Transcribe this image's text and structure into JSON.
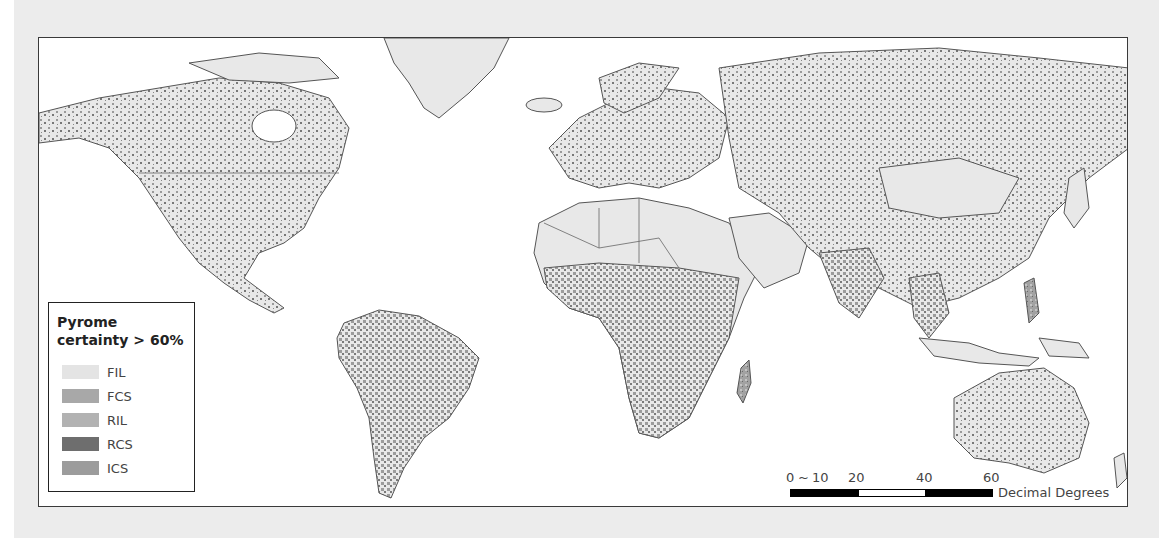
{
  "legend": {
    "title": "Pyrome\ncertainty > 60%",
    "items": [
      {
        "code": "FIL",
        "color": "#e4e4e4"
      },
      {
        "code": "FCS",
        "color": "#a8a8a8"
      },
      {
        "code": "RIL",
        "color": "#b2b2b2"
      },
      {
        "code": "RCS",
        "color": "#6e6e6e"
      },
      {
        "code": "ICS",
        "color": "#9c9c9c"
      }
    ]
  },
  "scale_bar": {
    "ticks": [
      "0",
      "10",
      "20",
      "40",
      "60"
    ],
    "unit": "Decimal Degrees"
  },
  "map": {
    "land_color": "#e8e8e8",
    "ocean_color": "#ffffff",
    "border_color": "#555555"
  }
}
